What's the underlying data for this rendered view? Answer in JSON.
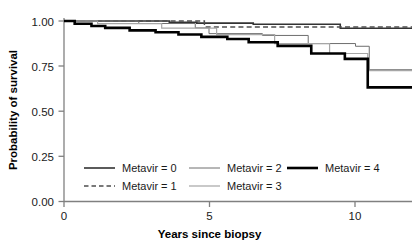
{
  "chart_data": {
    "type": "line",
    "subtype": "kaplan-meier-step",
    "title": "",
    "xlabel": "Years since biopsy",
    "ylabel": "Probability of survival",
    "xlim": [
      0,
      11.4
    ],
    "ylim": [
      0.0,
      1.0
    ],
    "xticks": [
      0,
      5,
      10
    ],
    "xtick_labels": [
      "0",
      "5",
      "10"
    ],
    "yticks": [
      0.0,
      0.25,
      0.5,
      0.75,
      1.0
    ],
    "ytick_labels": [
      "0.00",
      "0.25",
      "0.50",
      "0.75",
      "1.00"
    ],
    "grid": false,
    "legend_position": "inside-lower-left",
    "series": [
      {
        "name": "Metavir = 0",
        "legend_label": "Metavir = 0",
        "style": "solid",
        "color": "#333333",
        "width": 1.6,
        "final_value": 0.96,
        "x": [
          0.0,
          3.45,
          3.45,
          4.35,
          4.35,
          6.2,
          6.2,
          9.05,
          9.05,
          11.4
        ],
        "y": [
          1.0,
          1.0,
          0.993,
          0.993,
          0.988,
          0.988,
          0.982,
          0.982,
          0.96,
          0.96
        ]
      },
      {
        "name": "Metavir = 1",
        "legend_label": "Metavir = 1",
        "style": "dashed",
        "color": "#4d4d4d",
        "width": 1.4,
        "final_value": 0.965,
        "x": [
          0.0,
          4.6,
          4.6,
          11.4
        ],
        "y": [
          1.0,
          1.0,
          0.967,
          0.967
        ]
      },
      {
        "name": "Metavir = 2",
        "legend_label": "Metavir = 2",
        "style": "solid",
        "color": "#6e6e6e",
        "width": 1.0,
        "final_value": 0.73,
        "x": [
          0.0,
          2.45,
          2.45,
          4.3,
          4.3,
          4.75,
          4.75,
          6.5,
          6.5,
          8.0,
          8.0,
          9.55,
          9.55,
          10.0,
          10.0,
          11.4
        ],
        "y": [
          1.0,
          1.0,
          0.986,
          0.986,
          0.962,
          0.962,
          0.93,
          0.93,
          0.92,
          0.92,
          0.875,
          0.875,
          0.86,
          0.86,
          0.73,
          0.73
        ]
      },
      {
        "name": "Metavir = 3",
        "legend_label": "Metavir = 3",
        "style": "solid",
        "color": "#a6a6a6",
        "width": 1.2,
        "final_value": 0.72,
        "x": [
          0.0,
          1.1,
          1.1,
          3.2,
          3.2,
          5.0,
          5.0,
          6.9,
          6.9,
          8.7,
          8.7,
          9.95,
          9.95,
          11.4
        ],
        "y": [
          1.0,
          1.0,
          0.985,
          0.985,
          0.96,
          0.96,
          0.925,
          0.925,
          0.875,
          0.875,
          0.82,
          0.82,
          0.725,
          0.725
        ]
      },
      {
        "name": "Metavir = 4",
        "legend_label": "Metavir = 4",
        "style": "solid",
        "color": "#000000",
        "width": 2.6,
        "final_value": 0.63,
        "x": [
          0.0,
          0.35,
          0.35,
          0.9,
          0.9,
          1.35,
          1.35,
          2.15,
          2.15,
          3.0,
          3.0,
          3.75,
          3.75,
          4.5,
          4.5,
          5.35,
          5.35,
          6.05,
          6.05,
          7.0,
          7.0,
          8.1,
          8.1,
          9.2,
          9.2,
          9.95,
          9.95,
          11.4
        ],
        "y": [
          1.0,
          1.0,
          0.985,
          0.985,
          0.972,
          0.972,
          0.962,
          0.962,
          0.948,
          0.948,
          0.938,
          0.938,
          0.925,
          0.925,
          0.912,
          0.912,
          0.9,
          0.9,
          0.882,
          0.882,
          0.862,
          0.862,
          0.82,
          0.82,
          0.79,
          0.79,
          0.632,
          0.632
        ]
      }
    ]
  },
  "axes": {
    "x_title": "Years since biopsy",
    "y_title": "Probability of survival",
    "x_tick_0": "0",
    "x_tick_5": "5",
    "x_tick_10": "10",
    "y_tick_000": "0.00",
    "y_tick_025": "0.25",
    "y_tick_050": "0.50",
    "y_tick_075": "0.75",
    "y_tick_100": "1.00"
  },
  "legend": {
    "entries": [
      {
        "label": "Metavir = 0",
        "style": "solid",
        "color": "#333333",
        "width": 1.6
      },
      {
        "label": "Metavir = 2",
        "style": "solid",
        "color": "#6e6e6e",
        "width": 1.0
      },
      {
        "label": "Metavir = 4",
        "style": "solid",
        "color": "#000000",
        "width": 2.6
      },
      {
        "label": "Metavir = 1",
        "style": "dashed",
        "color": "#4d4d4d",
        "width": 1.4
      },
      {
        "label": "Metavir = 3",
        "style": "solid",
        "color": "#a6a6a6",
        "width": 1.2
      }
    ]
  },
  "colors": {
    "axis": "#808080",
    "text": "#1a1a1a",
    "background": "#ffffff"
  }
}
